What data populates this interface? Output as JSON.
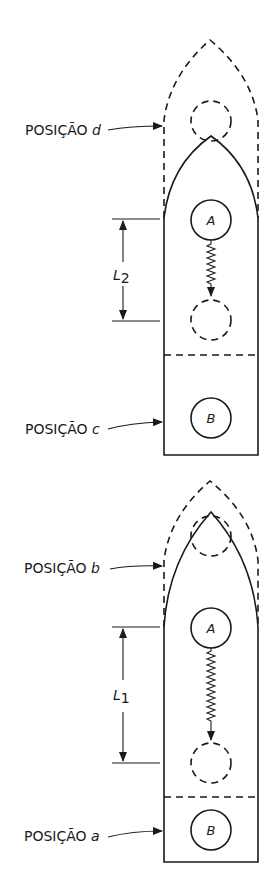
{
  "figure": {
    "top_panel": {
      "labels": {
        "position_d": {
          "prefix": "POSIÇÃO ",
          "letter": "d"
        },
        "position_c": {
          "prefix": "POSIÇÃO ",
          "letter": "c"
        }
      },
      "dimension": {
        "symbol": "L",
        "subscript": "2"
      },
      "mass_a": "A",
      "mass_b": "B"
    },
    "bottom_panel": {
      "labels": {
        "position_b": {
          "prefix": "POSIÇÃO ",
          "letter": "b"
        },
        "position_a": {
          "prefix": "POSIÇÃO ",
          "letter": "a"
        }
      },
      "dimension": {
        "symbol": "L",
        "subscript": "1"
      },
      "mass_a": "A",
      "mass_b": "B"
    }
  },
  "colors": {
    "stroke": "#1a1a1a",
    "background": "#ffffff"
  }
}
